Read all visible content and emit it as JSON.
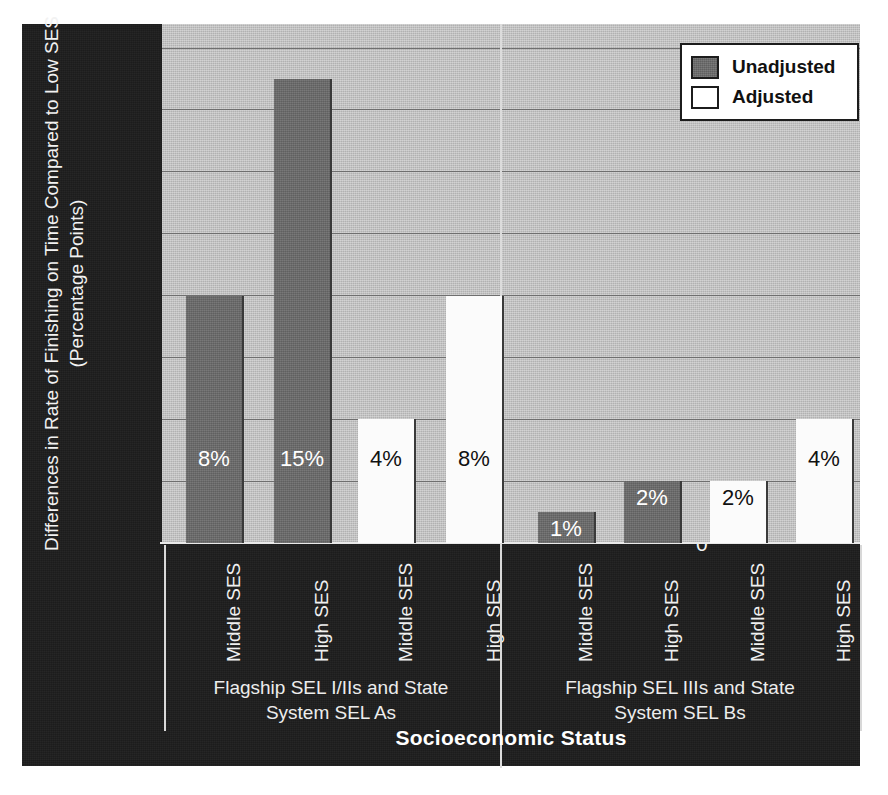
{
  "chart_data": {
    "type": "bar",
    "title": "",
    "xlabel": "Socioeconomic Status",
    "ylabel_line1": "Differences in Rate of Finishing on Time Compared to Low SES",
    "ylabel_line2": "(Percentage Points)",
    "ylim": [
      0,
      16
    ],
    "yticks": [
      0,
      2,
      4,
      6,
      8,
      10,
      12,
      14,
      16
    ],
    "ytick_labels": [
      "0",
      "2",
      "4",
      "6",
      "8",
      "10",
      "12",
      "14",
      "16"
    ],
    "grid": true,
    "legend_position": "top-right",
    "legend": [
      {
        "name": "Unadjusted",
        "color": "#6b6b6b"
      },
      {
        "name": "Adjusted",
        "color": "#ffffff"
      }
    ],
    "groups": [
      {
        "label": "Flagship SEL I/IIs and State\nSystem SEL As",
        "bars": [
          {
            "category": "Middle SES",
            "series": "Unadjusted",
            "value": 8,
            "data_label": "8%"
          },
          {
            "category": "High SES",
            "series": "Unadjusted",
            "value": 15,
            "data_label": "15%"
          },
          {
            "category": "Middle SES",
            "series": "Adjusted",
            "value": 4,
            "data_label": "4%"
          },
          {
            "category": "High SES",
            "series": "Adjusted",
            "value": 8,
            "data_label": "8%"
          }
        ]
      },
      {
        "label": "Flagship SEL IIIs and State\nSystem SEL Bs",
        "bars": [
          {
            "category": "Middle SES",
            "series": "Unadjusted",
            "value": 1,
            "data_label": "1%"
          },
          {
            "category": "High SES",
            "series": "Unadjusted",
            "value": 2,
            "data_label": "2%"
          },
          {
            "category": "Middle SES",
            "series": "Adjusted",
            "value": 2,
            "data_label": "2%"
          },
          {
            "category": "High SES",
            "series": "Adjusted",
            "value": 4,
            "data_label": "4%"
          }
        ]
      }
    ],
    "categories": [
      "Middle SES",
      "High SES",
      "Middle SES",
      "High SES",
      "Middle SES",
      "High SES",
      "Middle SES",
      "High SES"
    ],
    "values": [
      8,
      15,
      4,
      8,
      1,
      2,
      2,
      4
    ],
    "colors": {
      "plot_background": "#c3c3c3",
      "panel_background": "#1d1d1d",
      "unadjusted": "#6b6b6b",
      "adjusted": "#ffffff",
      "gridline": "#6f6f6f",
      "axis_text": "#f2f2f2"
    }
  }
}
